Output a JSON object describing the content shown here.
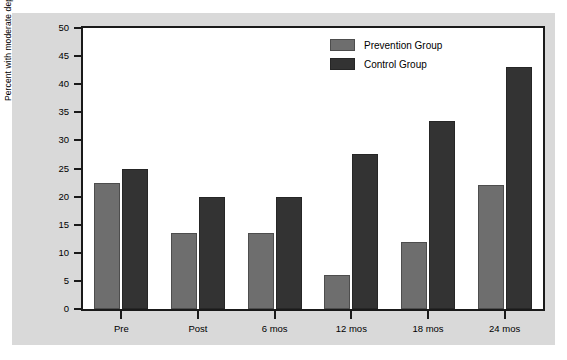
{
  "chart_data": {
    "type": "bar",
    "title": "",
    "subtitle": "",
    "xlabel": "",
    "ylabel": "Percent with moderate depressive symptoms",
    "categories": [
      "Pre",
      "Post",
      "6 mos",
      "12 mos",
      "18 mos",
      "24 mos"
    ],
    "series": [
      {
        "name": "Prevention Group",
        "color": "#6e6e6e",
        "values": [
          22.5,
          13.5,
          13.5,
          6.0,
          12.0,
          22.0
        ]
      },
      {
        "name": "Control Group",
        "color": "#333333",
        "values": [
          25.0,
          20.0,
          20.0,
          27.5,
          33.5,
          43.0
        ]
      }
    ],
    "ylim": [
      0,
      50
    ],
    "ytick_step": 5,
    "ytick_labels": [
      "0",
      "5",
      "10",
      "15",
      "20",
      "25",
      "30",
      "35",
      "40",
      "45",
      "50"
    ],
    "grid": false,
    "legend_position": "top-right",
    "legend_entries": [
      "Prevention Group",
      "Control Group"
    ],
    "colors": {
      "figure_background": "#ffffff",
      "panel_background": "#d9d9d9",
      "plot_background": "#ffffff",
      "axis": "#1a1a1a",
      "prevention": "#6e6e6e",
      "control": "#333333"
    }
  }
}
